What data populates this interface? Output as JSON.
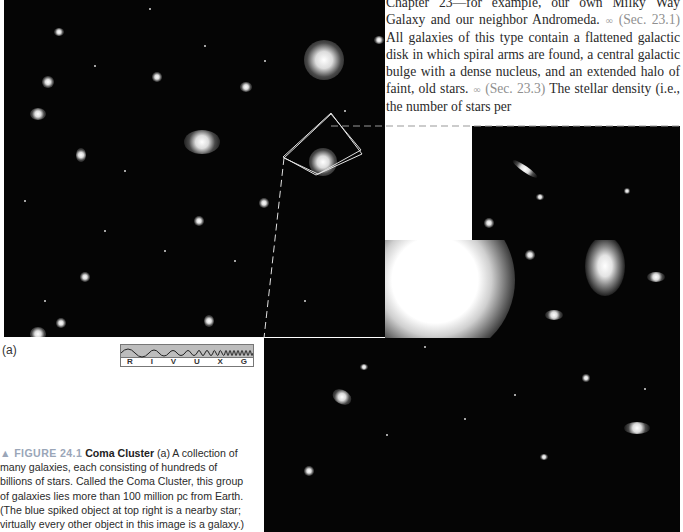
{
  "body_text": {
    "line0": "Chapter 23—for example, our own Milky Way",
    "line1_a": "Galaxy and our neighbor Andromeda.",
    "xref1": "(Sec. 23.1)",
    "para": "All galaxies of this type contain a flattened galactic disk in which spiral arms are found, a central galactic bulge with a dense nucleus, and an extended halo of faint, old stars.",
    "xref2": "(Sec. 23.3)",
    "line_last": "The stellar density (i.e., the number of stars per",
    "xref_icon": "∞"
  },
  "figure": {
    "panel_label": "(a)",
    "spectrum_bands": [
      "R",
      "I",
      "V",
      "U",
      "X",
      "G"
    ],
    "caption": {
      "tag": "▲ FIGURE 24.1",
      "title": "Coma Cluster",
      "text": "(a) A collection of many galaxies, each consisting of hundreds of billions of stars. Called the Coma Cluster, this group of galaxies lies more than 100 million pc from Earth. (The blue spiked object at top right is a nearby star; virtually every other object in this image is a galaxy.)"
    }
  },
  "colors": {
    "figure_tag": "#9aa6b8",
    "xref": "#8f8f8f",
    "image_bg": "#050505"
  }
}
